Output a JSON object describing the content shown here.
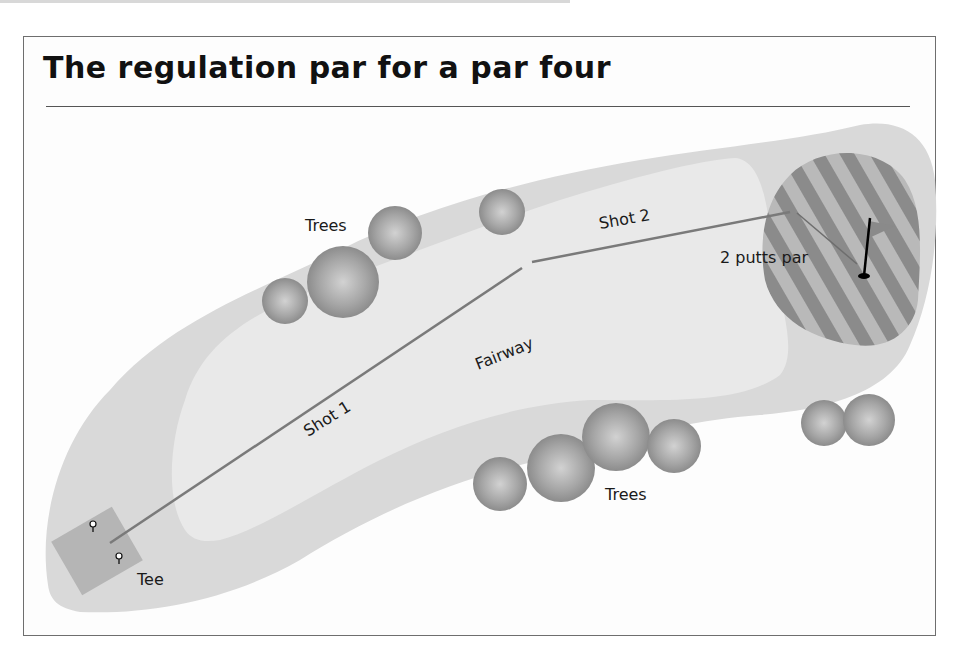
{
  "title": "The regulation par for a par four",
  "labels": {
    "trees_top": "Trees",
    "trees_bottom": "Trees",
    "fairway": "Fairway",
    "shot1": "Shot 1",
    "shot2": "Shot 2",
    "putts": "2 putts par",
    "tee": "Tee"
  },
  "colors": {
    "rough": "#d9d9d9",
    "fairway": "#e9e9e9",
    "green_stripe_dark": "#8a8a8a",
    "green_stripe_light": "#b8b8b8",
    "tee_box": "#b3b3b3",
    "shot_line": "#7a7a7a",
    "tree": "#9a9a9a"
  }
}
